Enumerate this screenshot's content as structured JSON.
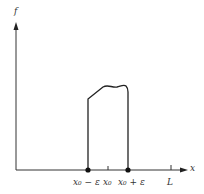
{
  "figure": {
    "y_axis_label": "f",
    "x_axis_label": "x",
    "tick_labels": {
      "left_edge": "x₀ − ε",
      "center": "x₀",
      "right_edge": "x₀ + ε",
      "end": "L"
    },
    "colors": {
      "line": "#222222",
      "axis": "#333333",
      "text": "#333333"
    }
  }
}
